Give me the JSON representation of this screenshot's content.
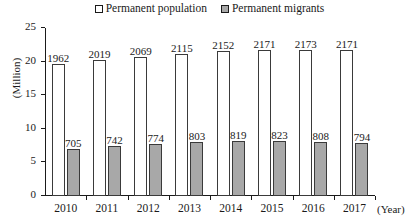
{
  "legend": {
    "entries": [
      {
        "label": "Permanent population",
        "swatch": "white-square-icon",
        "color": "#ffffff"
      },
      {
        "label": "Permanent migrants",
        "swatch": "gray-square-icon",
        "color": "#a8a8a8"
      }
    ]
  },
  "axes": {
    "y_title": "(Million)",
    "x_title": "(Year)",
    "y_ticks": [
      "0",
      "5",
      "10",
      "15",
      "20",
      "25"
    ]
  },
  "chart_data": {
    "type": "bar",
    "title": "",
    "subtitle": "",
    "xlabel": "(Year)",
    "ylabel": "(Million)",
    "ylim": [
      0,
      25
    ],
    "yticks": [
      0,
      5,
      10,
      15,
      20,
      25
    ],
    "grid": false,
    "legend_position": "top-center",
    "value_unit": "ten thousand",
    "note": "Bar value labels are in units of 10,000 persons; the y-axis is in millions (label/100).",
    "categories": [
      "2010",
      "2011",
      "2012",
      "2013",
      "2014",
      "2015",
      "2016",
      "2017"
    ],
    "series": [
      {
        "name": "Permanent population",
        "color": "#ffffff",
        "edge_color": "#3a3a3a",
        "values": [
          1962,
          2019,
          2069,
          2115,
          2152,
          2171,
          2173,
          2171
        ],
        "values_million": [
          19.62,
          20.19,
          20.69,
          21.15,
          21.52,
          21.71,
          21.73,
          21.71
        ]
      },
      {
        "name": "Permanent migrants",
        "color": "#a8a8a8",
        "edge_color": "#3a3a3a",
        "values": [
          705,
          742,
          774,
          803,
          819,
          823,
          808,
          794
        ],
        "values_million": [
          7.05,
          7.42,
          7.74,
          8.03,
          8.19,
          8.23,
          8.08,
          7.94
        ]
      }
    ]
  }
}
